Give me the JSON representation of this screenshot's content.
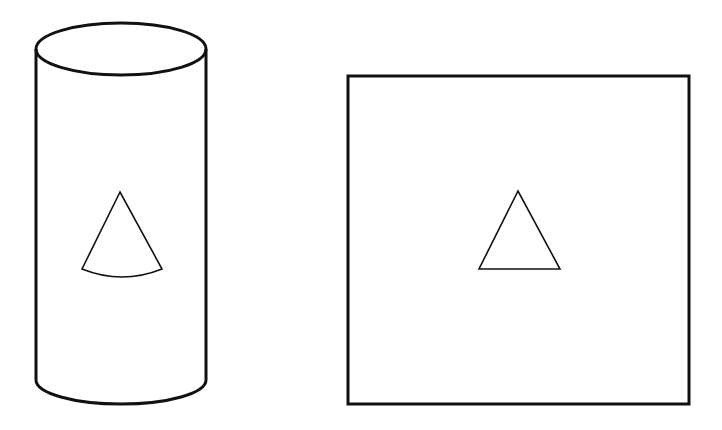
{
  "diagram": {
    "background": "#ffffff",
    "stroke_color": "#111111",
    "shapes": [
      {
        "id": "cylinder",
        "type": "cylinder",
        "left_x": 36,
        "right_x": 206,
        "top_center_y": 49,
        "top_ry": 26,
        "bottom_center_y": 380,
        "bottom_ry": 24,
        "inner_shape": {
          "id": "curved-triangle-on-cylinder",
          "type": "sector",
          "apex": [
            120,
            192
          ],
          "base_left": [
            82,
            269
          ],
          "base_right": [
            162,
            269
          ],
          "base_curve_dip_y": 278
        }
      },
      {
        "id": "square",
        "type": "rectangle",
        "x": 348,
        "y": 76,
        "width": 341,
        "height": 328,
        "inner_shape": {
          "id": "triangle-on-square",
          "type": "triangle",
          "apex": [
            518,
            191
          ],
          "base_left": [
            479,
            269
          ],
          "base_right": [
            560,
            269
          ]
        }
      }
    ]
  }
}
